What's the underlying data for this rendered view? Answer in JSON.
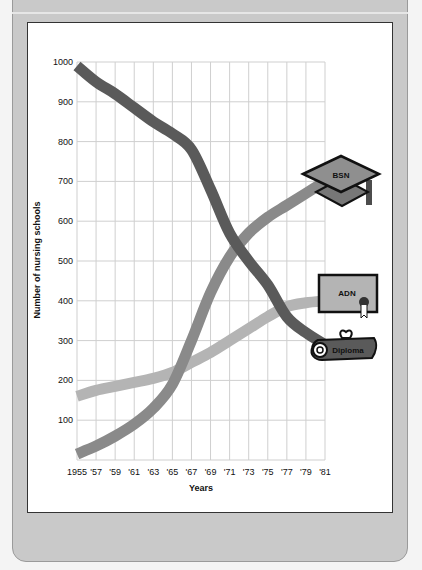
{
  "chart_data": {
    "type": "line",
    "title": "",
    "xlabel": "Years",
    "ylabel": "Number of nursing schools",
    "x": [
      1955,
      1957,
      1959,
      1961,
      1963,
      1965,
      1967,
      1969,
      1971,
      1973,
      1975,
      1977,
      1979,
      1981
    ],
    "x_tick_labels": [
      "1955",
      "'57",
      "'59",
      "'61",
      "'63",
      "'65",
      "'67",
      "'69",
      "'71",
      "'73",
      "'75",
      "'77",
      "'79",
      "'81"
    ],
    "y_ticks": [
      100,
      200,
      300,
      400,
      500,
      600,
      700,
      800,
      900,
      1000
    ],
    "ylim": [
      0,
      1000
    ],
    "grid": true,
    "legend_position": "right (icon labels at line ends)",
    "series": [
      {
        "name": "Diploma",
        "color": "#5a5a5a",
        "values": [
          990,
          950,
          920,
          885,
          850,
          820,
          780,
          680,
          570,
          500,
          440,
          360,
          320,
          290
        ]
      },
      {
        "name": "BSN",
        "color": "#8a8a8a",
        "values": [
          15,
          35,
          60,
          90,
          130,
          190,
          300,
          420,
          510,
          570,
          610,
          640,
          670,
          700
        ]
      },
      {
        "name": "ADN",
        "color": "#b4b4b4",
        "values": [
          160,
          175,
          185,
          195,
          205,
          220,
          245,
          270,
          300,
          330,
          360,
          385,
          395,
          400
        ]
      }
    ]
  },
  "labels": {
    "bsn": "BSN",
    "adn": "ADN",
    "diploma": "Diploma",
    "xlabel": "Years",
    "ylabel": "Number of nursing schools"
  }
}
